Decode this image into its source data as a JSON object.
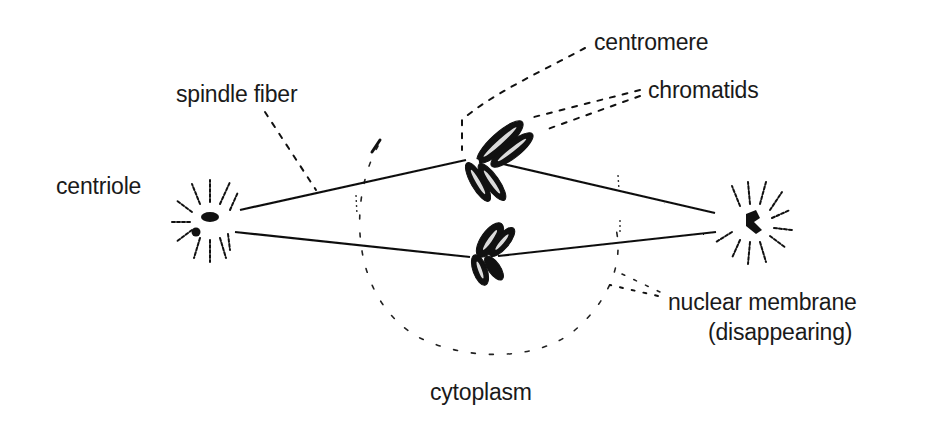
{
  "diagram": {
    "background": "#ffffff",
    "ink_color": "#111111",
    "labels": {
      "centromere": "centromere",
      "chromatids": "chromatids",
      "spindle_fiber": "spindle fiber",
      "centriole": "centriole",
      "nuclear_membrane_line1": "nuclear membrane",
      "nuclear_membrane_line2": "(disappearing)",
      "cytoplasm": "cytoplasm"
    },
    "structures": [
      {
        "name": "centriole-left",
        "x": 210,
        "y": 220
      },
      {
        "name": "centriole-right",
        "x": 752,
        "y": 222
      },
      {
        "name": "chromosome-upper",
        "x": 485,
        "y": 165
      },
      {
        "name": "chromosome-lower",
        "x": 485,
        "y": 255
      },
      {
        "name": "spindle-fiber-upper-left",
        "from": [
          240,
          210
        ],
        "to": [
          465,
          160
        ]
      },
      {
        "name": "spindle-fiber-upper-right",
        "from": [
          505,
          165
        ],
        "to": [
          715,
          213
        ]
      },
      {
        "name": "spindle-fiber-lower-left",
        "from": [
          235,
          232
        ],
        "to": [
          470,
          257
        ]
      },
      {
        "name": "spindle-fiber-lower-right",
        "from": [
          500,
          255
        ],
        "to": [
          715,
          232
        ]
      },
      {
        "name": "nuclear-membrane-arc",
        "center": [
          490,
          230
        ],
        "radius": 135
      }
    ]
  }
}
